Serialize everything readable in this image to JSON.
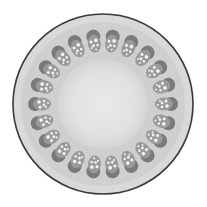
{
  "image": {
    "subject": "plant stem cross-section micrograph",
    "description": "Grayscale light micrograph of a dicot stem transverse section with a ring of vascular bundles around a central pith",
    "width": 207,
    "height": 207
  },
  "specimen": {
    "center": [
      103,
      104
    ],
    "outer_radius": 90,
    "bundle_ring_radius": 62,
    "bundle_count": 22,
    "pith_radius": 45
  },
  "colors": {
    "background": "#ffffff",
    "epidermis": "#3a3a3a",
    "cortex": "#d9d9d9",
    "cortex_inner": "#c8c8c8",
    "bundle_cap": "#7a7a7a",
    "bundle_body": "#9a9a9a",
    "xylem_vessel": "#f4f4f4",
    "pith": "#e6e6e6",
    "pith_center": "#f2f2f2"
  }
}
